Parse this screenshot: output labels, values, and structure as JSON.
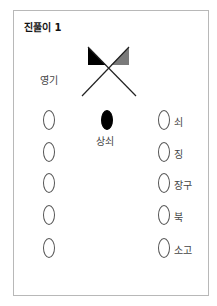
{
  "title": "진풀이 1",
  "flag": {
    "label": "영기",
    "left_flag_color": "#000000",
    "right_flag_color": "#7a7a7a"
  },
  "leader": {
    "label": "상쇠",
    "color": "#000000"
  },
  "left_column": {
    "count": 5
  },
  "right_column": {
    "items": [
      {
        "label": "쇠"
      },
      {
        "label": "징"
      },
      {
        "label": "장구"
      },
      {
        "label": "북"
      },
      {
        "label": "소고"
      }
    ]
  }
}
